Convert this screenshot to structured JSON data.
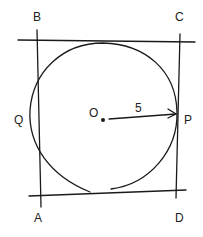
{
  "diagram": {
    "type": "geometry",
    "labels": {
      "B": "B",
      "C": "C",
      "A": "A",
      "D": "D",
      "O": "O",
      "P": "P",
      "Q": "Q",
      "radius": "5"
    },
    "colors": {
      "stroke": "#1a1a1a",
      "background": "#ffffff"
    }
  }
}
